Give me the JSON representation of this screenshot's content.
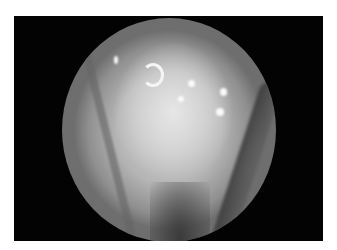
{
  "image": {
    "description": "Grayscale endoscopic view inside circular scope field on black background, white outer margin",
    "colors": {
      "background": "#ffffff",
      "frame": "#030303",
      "tissue_light": "#e6e6e6",
      "tissue_mid": "#b5b5b5",
      "tissue_dark": "#6e6e6e"
    }
  }
}
